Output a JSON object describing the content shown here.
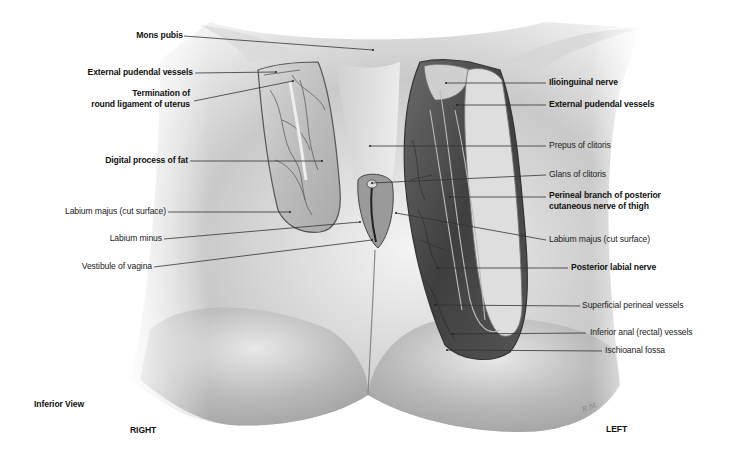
{
  "figure": {
    "view": "Inferior View",
    "orientation": {
      "left_side": "RIGHT",
      "right_side": "LEFT"
    },
    "signature": "R.M."
  },
  "labels_left": [
    {
      "id": "mons-pubis",
      "text": "Mons pubis",
      "bold": true
    },
    {
      "id": "external-pudendal-vessels-right",
      "text": "External pudendal vessels",
      "bold": true
    },
    {
      "id": "termination-round-ligament",
      "line1": "Termination of",
      "line2": "round ligament of uterus",
      "bold": true
    },
    {
      "id": "digital-process-of-fat",
      "text": "Digital process of fat",
      "bold": true
    },
    {
      "id": "labium-majus-cut-right",
      "text": "Labium majus (cut surface)",
      "bold": false
    },
    {
      "id": "labium-minus",
      "text": "Labium minus",
      "bold": false
    },
    {
      "id": "vestibule-of-vagina",
      "text": "Vestibule of vagina",
      "bold": false
    }
  ],
  "labels_right": [
    {
      "id": "ilioinguinal-nerve",
      "text": "Ilioinguinal nerve",
      "bold": true
    },
    {
      "id": "external-pudendal-vessels-left",
      "text": "External pudendal vessels",
      "bold": true
    },
    {
      "id": "prepuce-of-clitoris",
      "text": "Prepus of clitoris",
      "bold": false
    },
    {
      "id": "glans-of-clitoris",
      "text": "Glans of clitoris",
      "bold": false
    },
    {
      "id": "perineal-branch",
      "line1": "Perineal branch of posterior",
      "line2": "cutaneous nerve of thigh",
      "bold": true
    },
    {
      "id": "labium-majus-cut-left",
      "text": "Labium majus (cut surface)",
      "bold": false
    },
    {
      "id": "posterior-labial-nerve",
      "text": "Posterior labial nerve",
      "bold": true
    },
    {
      "id": "superficial-perineal-vessels",
      "text": "Superficial perineal vessels",
      "bold": false
    },
    {
      "id": "inferior-anal-vessels",
      "text": "Inferior anal (rectal) vessels",
      "bold": false
    },
    {
      "id": "ischioanal-fossa",
      "text": "Ischioanal fossa",
      "bold": false
    }
  ],
  "colors": {
    "label_text": "#222222",
    "leader_line": "#333333",
    "skin_light": "#f2f2f2",
    "skin_shadow": "#8a8a8a",
    "dissection_dark": "#3a3a3a"
  }
}
